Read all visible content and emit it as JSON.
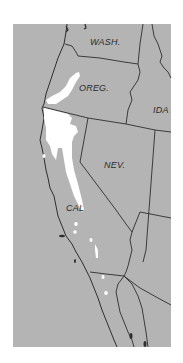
{
  "map": {
    "background_color": "#b4b4b4",
    "range_color": "#ffffff",
    "border_color": "#2e2e2e",
    "labels": {
      "wash": "WASH.",
      "oreg": "OREG.",
      "ida": "IDA",
      "nev": "NEV.",
      "cal": "CAL"
    }
  }
}
